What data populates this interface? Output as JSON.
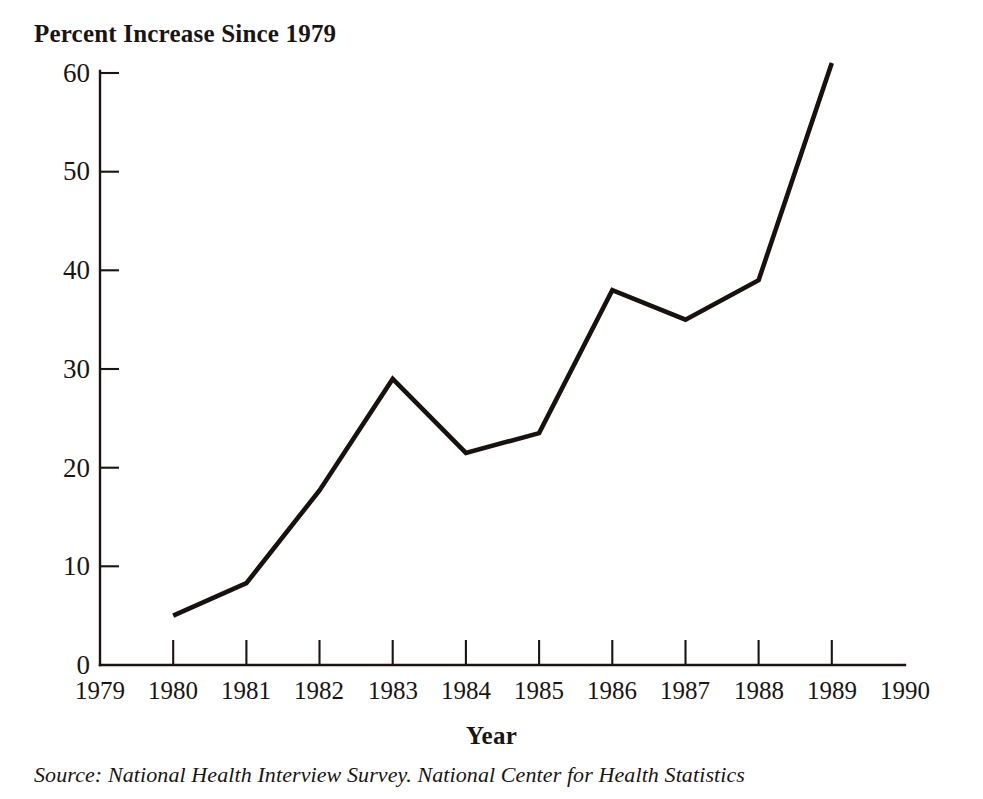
{
  "chart_data": {
    "type": "line",
    "title": "Percent Increase Since 1979",
    "xlabel": "Year",
    "ylabel": "",
    "x": [
      1980,
      1981,
      1982,
      1983,
      1984,
      1985,
      1986,
      1987,
      1988,
      1989
    ],
    "values": [
      5.0,
      8.3,
      17.7,
      29.0,
      21.5,
      23.5,
      38.0,
      35.0,
      39.0,
      61.0
    ],
    "series": [
      {
        "name": "Percent Increase Since 1979",
        "values": [
          5.0,
          8.3,
          17.7,
          29.0,
          21.5,
          23.5,
          38.0,
          35.0,
          39.0,
          61.0
        ]
      }
    ],
    "xlim": [
      1979,
      1990
    ],
    "ylim": [
      0,
      60
    ],
    "x_tick_labels": [
      "1979",
      "1980",
      "1981",
      "1982",
      "1983",
      "1984",
      "1985",
      "1986",
      "1987",
      "1988",
      "1989",
      "1990"
    ],
    "y_tick_labels": [
      "0",
      "10",
      "20",
      "30",
      "40",
      "50",
      "60"
    ],
    "y_ticks": [
      0,
      10,
      20,
      30,
      40,
      50,
      60
    ],
    "grid": false,
    "legend": "none",
    "line_color": "#17120f",
    "background_color": "#ffffff"
  },
  "chart": {
    "title": "Percent Increase Since 1979",
    "x_axis_title": "Year",
    "source_note": "Source: National Health Interview Survey. National Center for Health Statistics"
  }
}
